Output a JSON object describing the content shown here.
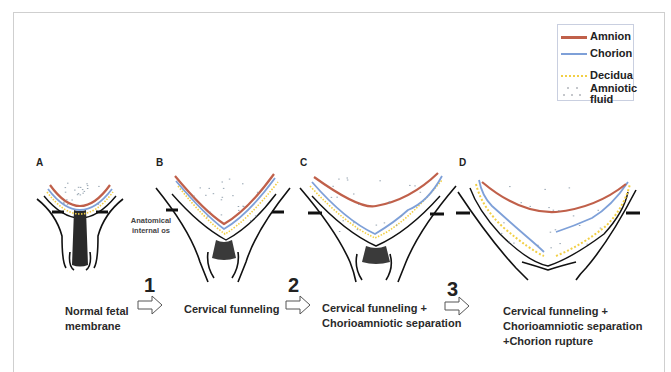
{
  "legend": {
    "items": [
      {
        "key": "amnion",
        "label": "Amnion",
        "color": "#c0604a",
        "style": "solid"
      },
      {
        "key": "chorion",
        "label": "Chorion",
        "color": "#7ea0d8",
        "style": "solid"
      },
      {
        "key": "decidua",
        "label": "Decidua",
        "color": "#f2cf45",
        "style": "dotted"
      },
      {
        "key": "amniotic_fluid",
        "label": "Amniotic fluid",
        "label_line1": "Amniotic",
        "label_line2": "fluid",
        "color": "#8a8f98",
        "style": "dashes"
      }
    ]
  },
  "panels": [
    {
      "letter": "A",
      "stage": "Normal fetal membrane"
    },
    {
      "letter": "B",
      "stage": "Cervical funneling"
    },
    {
      "letter": "C",
      "stage": "Cervical funneling + Chorioamniotic separation"
    },
    {
      "letter": "D",
      "stage": "Cervical funneling + Chorioamniotic separation +Chorion rupture"
    }
  ],
  "annotation": {
    "line1": "Anatomical",
    "line2": "internal os"
  },
  "steps": [
    {
      "number": "1"
    },
    {
      "number": "2"
    },
    {
      "number": "3"
    }
  ],
  "captions": [
    {
      "line1": "Normal fetal",
      "line2": "membrane"
    },
    {
      "line1": "Cervical funneling"
    },
    {
      "line1": "Cervical funneling +",
      "line2": "Chorioamniotic separation"
    },
    {
      "line1": "Cervical funneling +",
      "line2": "Chorioamniotic separation",
      "line3": "+Chorion rupture"
    }
  ],
  "colors": {
    "amnion": "#c0604a",
    "chorion": "#7ea0d8",
    "decidua": "#f2cf45",
    "outline": "#111111",
    "fluid": "#8a9aa8"
  }
}
